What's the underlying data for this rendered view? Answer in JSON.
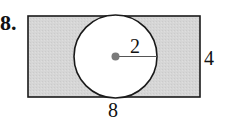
{
  "problem": {
    "number": "8.",
    "figure": {
      "shape": "rectangle with inscribed circle",
      "rectangle": {
        "width_label": "8",
        "height_label": "4",
        "fill": "#d4d4d4",
        "stroke": "#1a1a1a"
      },
      "circle": {
        "radius_label": "2",
        "fill": "#ffffff",
        "stroke": "#1a1a1a",
        "center_dot_color": "#7a7a7a"
      }
    }
  }
}
